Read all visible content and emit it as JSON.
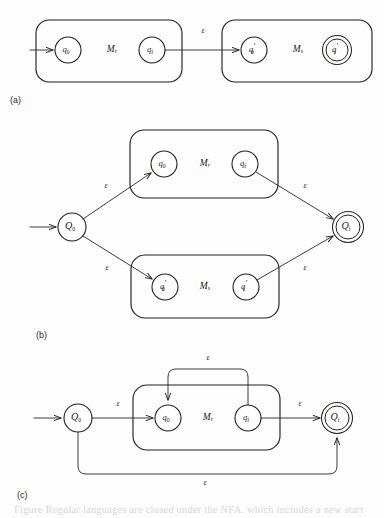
{
  "figure": {
    "width": 384,
    "height": 518,
    "background_color": "#fdfdfd",
    "ink_color": "#23211f",
    "caption_partial": "Figure   Regular languages are closed under the NFA. which includes a new start",
    "epsilon_symbol": "ε",
    "panels": [
      {
        "id": "a",
        "label": "(a)"
      },
      {
        "id": "b",
        "label": "(b)"
      },
      {
        "id": "c",
        "label": "(c)"
      }
    ]
  },
  "panel_a": {
    "label": "(a)",
    "label_x": 10,
    "label_y": 101,
    "machines": [
      {
        "name": "M",
        "subscript": "r",
        "box": {
          "x": 36,
          "y": 20,
          "w": 146,
          "h": 62,
          "r": 13
        },
        "label_x": 112,
        "label_y": 50,
        "states": [
          {
            "id": "q0",
            "base": "q",
            "sub": "0",
            "prime": false,
            "accepting": false,
            "cx": 68,
            "cy": 50,
            "r": 13
          },
          {
            "id": "qf",
            "base": "q",
            "sub": "f",
            "prime": false,
            "accepting": false,
            "cx": 152,
            "cy": 50,
            "r": 13
          }
        ]
      },
      {
        "name": "M",
        "subscript": "s",
        "box": {
          "x": 222,
          "y": 20,
          "w": 150,
          "h": 62,
          "r": 13
        },
        "label_x": 298,
        "label_y": 50,
        "states": [
          {
            "id": "q0p",
            "base": "q",
            "sub": "0",
            "prime": true,
            "accepting": false,
            "cx": 254,
            "cy": 50,
            "r": 13
          },
          {
            "id": "qfp",
            "base": "q",
            "sub": "f",
            "prime": true,
            "accepting": true,
            "cx": 337,
            "cy": 50,
            "r": 14
          }
        ]
      }
    ],
    "start_arrow": {
      "x1": 30,
      "y1": 50,
      "x2": 54,
      "y2": 50
    },
    "transitions": [
      {
        "from": "qf",
        "to": "q0p",
        "label": "ε",
        "label_x": 203,
        "label_y": 31,
        "path": "M 165 50 L 240 50"
      }
    ]
  },
  "panel_b": {
    "label": "(b)",
    "label_x": 36,
    "label_y": 336,
    "start_arrow": {
      "x1": 30,
      "y1": 227,
      "x2": 57,
      "y2": 227
    },
    "start_state": {
      "id": "Q0",
      "base": "Q",
      "sub": "0",
      "accepting": false,
      "cx": 72,
      "cy": 227,
      "r": 14
    },
    "final_state": {
      "id": "Qf",
      "base": "Q",
      "sub": "f",
      "accepting": true,
      "cx": 348,
      "cy": 227,
      "r": 15
    },
    "machines": [
      {
        "name": "M",
        "subscript": "r",
        "box": {
          "x": 130,
          "y": 130,
          "w": 148,
          "h": 68,
          "r": 14
        },
        "label_x": 205,
        "label_y": 164,
        "states": [
          {
            "id": "q0",
            "base": "q",
            "sub": "0",
            "prime": false,
            "accepting": false,
            "cx": 164,
            "cy": 164,
            "r": 13
          },
          {
            "id": "qf",
            "base": "q",
            "sub": "f",
            "prime": false,
            "accepting": false,
            "cx": 245,
            "cy": 164,
            "r": 13
          }
        ]
      },
      {
        "name": "M",
        "subscript": "s",
        "box": {
          "x": 131,
          "y": 255,
          "w": 148,
          "h": 63,
          "r": 14
        },
        "label_x": 205,
        "label_y": 287,
        "states": [
          {
            "id": "q0p",
            "base": "q",
            "sub": "0",
            "prime": true,
            "accepting": false,
            "cx": 165,
            "cy": 287,
            "r": 13
          },
          {
            "id": "qfp",
            "base": "q",
            "sub": "f",
            "prime": true,
            "accepting": false,
            "cx": 246,
            "cy": 287,
            "r": 13
          }
        ]
      }
    ],
    "transitions": [
      {
        "from": "Q0",
        "to": "q0(Mr)",
        "label": "ε",
        "label_x": 106,
        "label_y": 186,
        "path": "M 83 219 L 152 172"
      },
      {
        "from": "Q0",
        "to": "q0'(Ms)",
        "label": "ε",
        "label_x": 107,
        "label_y": 268,
        "path": "M 83 236 L 153 280"
      },
      {
        "from": "qf(Mr)",
        "to": "Qf",
        "label": "ε",
        "label_x": 305,
        "label_y": 186,
        "path": "M 256 172 L 334 219"
      },
      {
        "from": "qf'(Ms)",
        "to": "Qf",
        "label": "ε",
        "label_x": 305,
        "label_y": 268,
        "path": "M 257 280 L 334 236"
      }
    ]
  },
  "panel_c": {
    "label": "(c)",
    "label_x": 17,
    "label_y": 496,
    "start_arrow": {
      "x1": 34,
      "y1": 418,
      "x2": 62,
      "y2": 418
    },
    "start_state": {
      "id": "Q0",
      "base": "Q",
      "sub": "0",
      "accepting": false,
      "cx": 78,
      "cy": 418,
      "r": 14
    },
    "final_state": {
      "id": "Qf",
      "base": "Q",
      "sub": "f",
      "accepting": true,
      "cx": 337,
      "cy": 418,
      "r": 15
    },
    "machine": {
      "name": "M",
      "subscript": "r",
      "box": {
        "x": 133,
        "y": 385,
        "w": 147,
        "h": 65,
        "r": 14
      },
      "label_x": 208,
      "label_y": 418,
      "states": [
        {
          "id": "q0",
          "base": "q",
          "sub": "0",
          "prime": false,
          "accepting": false,
          "cx": 168,
          "cy": 418,
          "r": 13
        },
        {
          "id": "qf",
          "base": "q",
          "sub": "f",
          "prime": false,
          "accepting": false,
          "cx": 248,
          "cy": 418,
          "r": 13
        }
      ]
    },
    "transitions": [
      {
        "from": "Q0",
        "to": "q0",
        "label": "ε",
        "label_x": 118,
        "label_y": 404,
        "path": "M 92 418 L 154 418"
      },
      {
        "from": "qf",
        "to": "Qf",
        "label": "ε",
        "label_x": 300,
        "label_y": 404,
        "path": "M 261 418 L 321 418"
      },
      {
        "from": "qf",
        "to": "q0",
        "label": "ε",
        "label_x": 208,
        "label_y": 358,
        "path": "M 248 405 L 248 377 Q 248 369 240 369 L 176 369 Q 168 369 168 377 L 168 401"
      },
      {
        "from": "Q0",
        "to": "Qf",
        "label": "ε",
        "label_x": 205,
        "label_y": 483,
        "path": "M 78 432 L 78 466 Q 78 474 86 474 L 329 474 Q 337 474 337 466 L 337 437"
      }
    ]
  }
}
